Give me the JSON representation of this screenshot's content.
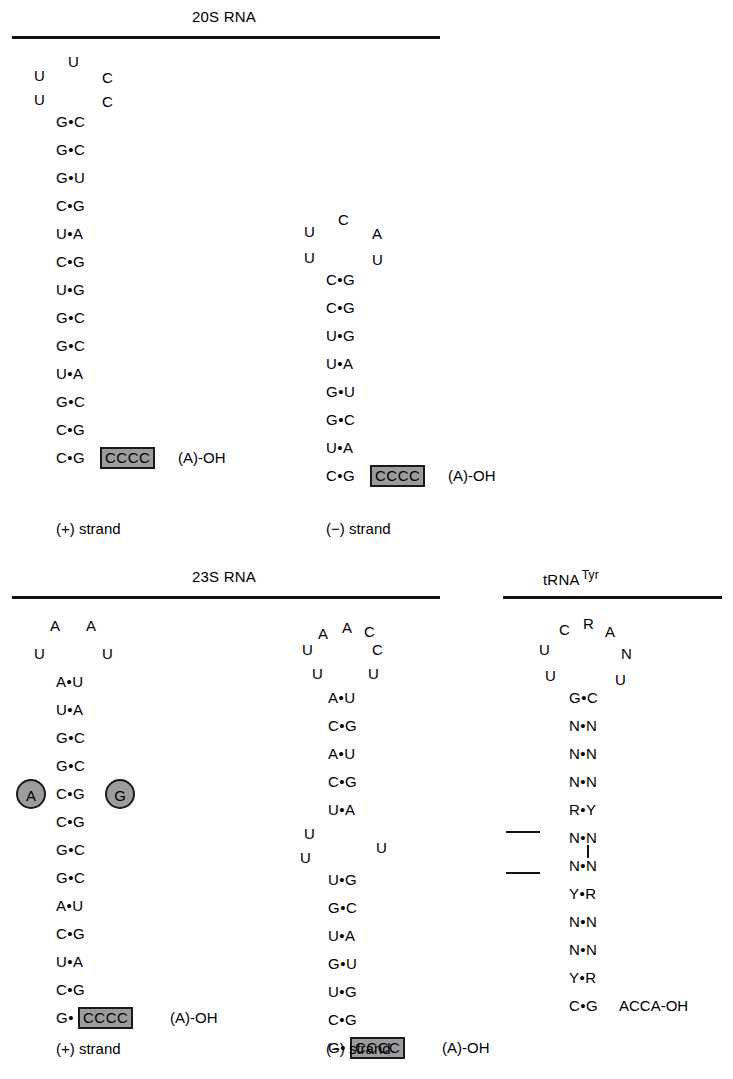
{
  "figure": {
    "type": "rna-secondary-structure-diagram",
    "panels": [
      {
        "id": "20s",
        "title": "20S RNA",
        "title_sup": "",
        "strands": [
          {
            "id": "20s-plus",
            "label": "(+) strand",
            "loop": [
              {
                "base": "U",
                "pos": "top-center"
              },
              {
                "base": "U",
                "pos": "left-upper"
              },
              {
                "base": "C",
                "pos": "right-upper"
              },
              {
                "base": "U",
                "pos": "left-lower"
              },
              {
                "base": "C",
                "pos": "right-lower"
              }
            ],
            "stem": [
              "G•C",
              "G•C",
              "G•U",
              "C•G",
              "U•A",
              "C•G",
              "U•G",
              "G•C",
              "G•C",
              "U•A",
              "G•C",
              "C•G",
              "C•G"
            ],
            "terminal_pair": "C•G",
            "boxed": "CCCC",
            "tail": "(A)-OH",
            "boxed_attached": false
          },
          {
            "id": "20s-minus",
            "label": "(−) strand",
            "loop": [
              {
                "base": "C",
                "pos": "top-center"
              },
              {
                "base": "U",
                "pos": "left-upper"
              },
              {
                "base": "A",
                "pos": "right-upper"
              },
              {
                "base": "U",
                "pos": "left-lower"
              },
              {
                "base": "U",
                "pos": "right-lower"
              }
            ],
            "stem": [
              "C•G",
              "C•G",
              "U•G",
              "U•A",
              "G•U",
              "G•C",
              "U•A"
            ],
            "terminal_pair": "C•G",
            "boxed": "CCCC",
            "tail": "(A)-OH",
            "boxed_attached": false
          }
        ]
      },
      {
        "id": "23s",
        "title": "23S RNA",
        "title_sup": "",
        "strands": [
          {
            "id": "23s-plus",
            "label": "(+) strand",
            "loop": [
              {
                "base": "A",
                "pos": "left-upper"
              },
              {
                "base": "A",
                "pos": "right-upper"
              },
              {
                "base": "U",
                "pos": "left-lower"
              },
              {
                "base": "U",
                "pos": "right-lower"
              }
            ],
            "stem": [
              "A•U",
              "U•A",
              "G•C",
              "G•C",
              "C•G",
              "C•G",
              "G•C",
              "G•C",
              "A•U",
              "C•G",
              "U•A",
              "C•G"
            ],
            "terminal_pair": "G•",
            "boxed": "CCCC",
            "tail": "(A)-OH",
            "boxed_attached": true,
            "circles": [
              {
                "base": "A",
                "side": "left"
              },
              {
                "base": "G",
                "side": "right"
              }
            ]
          },
          {
            "id": "23s-minus",
            "label": "(−) strand",
            "loop": [
              {
                "base": "A",
                "pos": "arc-left"
              },
              {
                "base": "A",
                "pos": "arc-top"
              },
              {
                "base": "C",
                "pos": "arc-right"
              },
              {
                "base": "U",
                "pos": "left-upper"
              },
              {
                "base": "C",
                "pos": "right-upper"
              },
              {
                "base": "U",
                "pos": "left-lower"
              },
              {
                "base": "U",
                "pos": "right-lower"
              }
            ],
            "stem_upper": [
              "A•U",
              "C•G",
              "A•U",
              "C•G",
              "U•A"
            ],
            "bulge": [
              {
                "base": "U",
                "pos": "left-upper"
              },
              {
                "base": "U",
                "pos": "left-lower"
              },
              {
                "base": "U",
                "pos": "right"
              }
            ],
            "stem_lower": [
              "U•G",
              "G•C",
              "U•A",
              "G•U",
              "U•G",
              "C•G"
            ],
            "terminal_pair": "G•",
            "boxed": "CCCC",
            "tail": "(A)-OH",
            "boxed_attached": true
          }
        ]
      },
      {
        "id": "trna",
        "title": "tRNA",
        "title_sup": "Tyr",
        "strands": [
          {
            "id": "trna-tyr",
            "label": "",
            "loop": [
              {
                "base": "C",
                "pos": "arc-left"
              },
              {
                "base": "R",
                "pos": "arc-top"
              },
              {
                "base": "A",
                "pos": "arc-right"
              },
              {
                "base": "U",
                "pos": "left-upper"
              },
              {
                "base": "N",
                "pos": "right-upper"
              },
              {
                "base": "U",
                "pos": "left-lower"
              },
              {
                "base": "U",
                "pos": "right-lower"
              }
            ],
            "stem": [
              "G•C",
              "N•N",
              "N•N",
              "N•N",
              "R•Y",
              "N•N",
              "N•N",
              "Y•R",
              "N•N",
              "N•N",
              "Y•R"
            ],
            "terminal_pair": "C•G",
            "boxed": "",
            "tail": "ACCA-OH",
            "boxed_attached": false,
            "marks": {
              "dash_rows": [
                "R•Y",
                "N•N"
              ],
              "vtick": true
            }
          }
        ]
      }
    ],
    "colors": {
      "box_fill": "#9c9c9c",
      "box_border": "#1a1a1a",
      "circle_fill": "#9c9c9c",
      "text": "#000000",
      "rule": "#111111",
      "background": "#ffffff"
    }
  }
}
